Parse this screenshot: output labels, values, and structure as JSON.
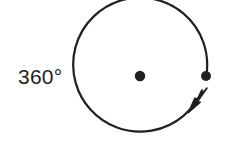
{
  "figure": {
    "kind": "geometry-diagram",
    "background_color": "#ffffff",
    "stroke_color": "#231f20",
    "text_color": "#231f20"
  },
  "label": {
    "angle_measure": "360°",
    "value": 360,
    "unit": "degrees",
    "x": 18,
    "y": 84
  },
  "circle": {
    "center_x": 140,
    "center_y": 76,
    "radius": 67,
    "stroke_width": 2.2
  },
  "center_point": {
    "name": "center-dot",
    "x": 140,
    "y": 76,
    "radius": 5.2
  },
  "terminal_point": {
    "name": "terminal-dot",
    "x": 206,
    "y": 76,
    "radius": 5.0
  },
  "arc": {
    "start_angle_deg": 0,
    "end_angle_deg": 348,
    "direction": "counterclockwise",
    "sweep_label": "360°",
    "path": "M 206.6 73.5 A 67 67 0 1 0 202 90.5"
  },
  "arrow_head": {
    "name": "arrowhead",
    "tip_x": 207,
    "tip_y": 88,
    "points": "207,88 197.5,101.5 200.2,102.2 188.5,112.5 194.8,98.2 197.4,99.0"
  }
}
